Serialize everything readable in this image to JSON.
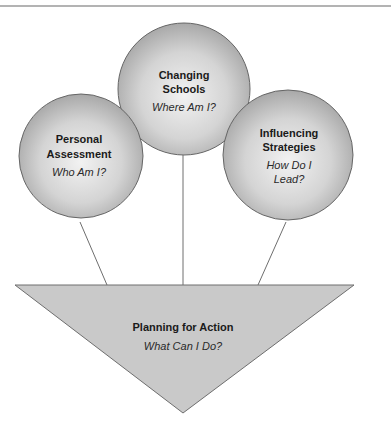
{
  "diagram": {
    "type": "leadership-planning-model",
    "colors": {
      "circle_center": "#eeeeee",
      "circle_edge": "#a9a9a9",
      "circle_stroke": "#666666",
      "triangle_fill": "#c9c9c9",
      "triangle_stroke": "#6e6e6e",
      "connector": "#6e6e6e",
      "rule": "#9a9a9a"
    },
    "nodes": {
      "personal": {
        "title_line1": "Personal",
        "title_line2": "Assessment",
        "question": "Who Am I?"
      },
      "changing": {
        "title_line1": "Changing",
        "title_line2": "Schools",
        "question": "Where Am I?"
      },
      "influencing": {
        "title_line1": "Influencing",
        "title_line2": "Strategies",
        "question_line1": "How Do I",
        "question_line2": "Lead?"
      },
      "planning": {
        "title": "Planning for Action",
        "question": "What Can I Do?"
      }
    }
  }
}
